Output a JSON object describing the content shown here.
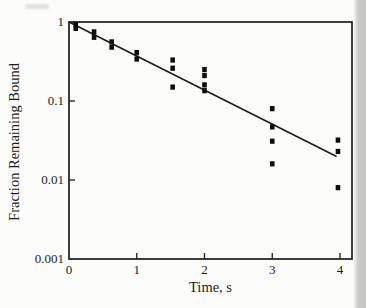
{
  "figure": {
    "background": "#fcfcfa",
    "ink": "#1c1c1c",
    "marker_color": "#0d0d0d",
    "scan_edge": "#c5c5c2",
    "smudge": "#d9d9d5"
  },
  "chart_data": {
    "type": "scatter",
    "title": "",
    "xlabel": "Time, s",
    "ylabel": "Fraction Remaining Bound",
    "x_axis": {
      "scale": "linear",
      "min": 0,
      "max": 4.18,
      "ticks": [
        0,
        1,
        2,
        3,
        4
      ],
      "tick_labels": [
        "0",
        "1",
        "2",
        "3",
        "4"
      ]
    },
    "y_axis": {
      "scale": "log",
      "min": 0.001,
      "max": 1,
      "ticks": [
        1,
        0.1,
        0.01,
        0.001
      ],
      "tick_labels": [
        "1",
        "0.1",
        "0.01",
        "0.001"
      ]
    },
    "grid": false,
    "legend": null,
    "marker": "filled-square",
    "points": [
      {
        "x": 0.1,
        "y": 0.93
      },
      {
        "x": 0.1,
        "y": 0.83
      },
      {
        "x": 0.37,
        "y": 0.75
      },
      {
        "x": 0.37,
        "y": 0.64
      },
      {
        "x": 0.63,
        "y": 0.56
      },
      {
        "x": 0.63,
        "y": 0.48
      },
      {
        "x": 1.0,
        "y": 0.41
      },
      {
        "x": 1.0,
        "y": 0.34
      },
      {
        "x": 1.53,
        "y": 0.33
      },
      {
        "x": 1.53,
        "y": 0.26
      },
      {
        "x": 1.53,
        "y": 0.15
      },
      {
        "x": 2.0,
        "y": 0.25
      },
      {
        "x": 2.0,
        "y": 0.21
      },
      {
        "x": 2.0,
        "y": 0.16
      },
      {
        "x": 2.0,
        "y": 0.135
      },
      {
        "x": 3.0,
        "y": 0.08
      },
      {
        "x": 3.0,
        "y": 0.047
      },
      {
        "x": 3.0,
        "y": 0.031
      },
      {
        "x": 3.0,
        "y": 0.016
      },
      {
        "x": 3.97,
        "y": 0.032
      },
      {
        "x": 3.97,
        "y": 0.023
      },
      {
        "x": 3.97,
        "y": 0.008
      }
    ],
    "fit_line": {
      "x": [
        0,
        3.95
      ],
      "y": [
        1.0,
        0.0198
      ]
    }
  }
}
